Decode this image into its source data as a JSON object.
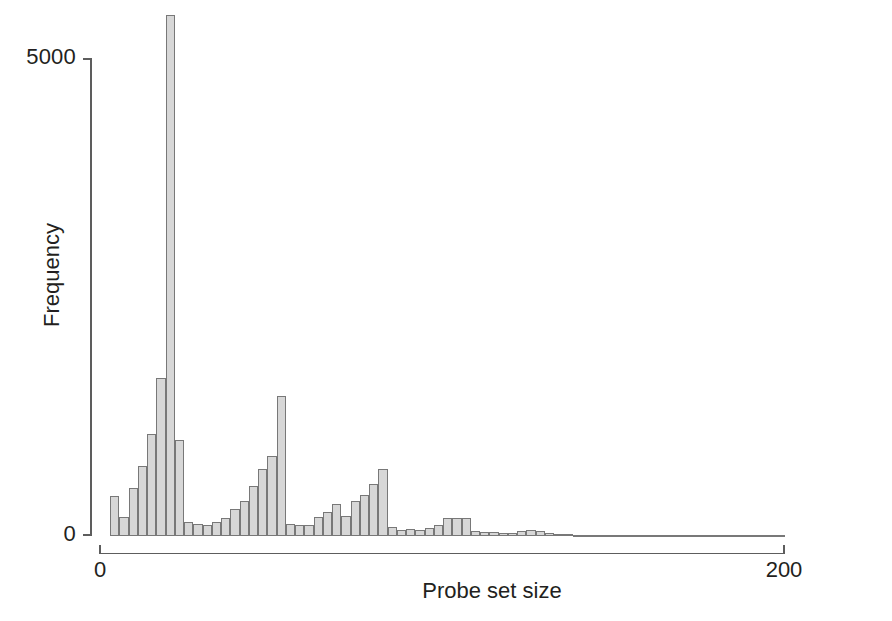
{
  "figure": {
    "background": "#ffffff",
    "width": 892,
    "height": 621
  },
  "axis_titles": {
    "x": "Probe set size",
    "y": "Frequency"
  },
  "ticks": {
    "y": [
      "0",
      "5000"
    ],
    "x": [
      "0",
      "200"
    ]
  },
  "style": {
    "bar_fill": "#d7d7d7",
    "bar_stroke": "#787878",
    "axis_color": "#5d5d5d",
    "text_color": "#231f20"
  },
  "chart_data": {
    "type": "bar",
    "title": "",
    "subtitle": "",
    "xlabel": "Probe set size",
    "ylabel": "Frequency",
    "xlim": [
      0,
      200
    ],
    "ylim": [
      0,
      5700
    ],
    "grid": false,
    "legend": null,
    "bin_width": 2.7,
    "x": [
      4.6,
      7.3,
      10.0,
      12.7,
      15.4,
      18.1,
      20.8,
      23.5,
      26.2,
      28.9,
      31.6,
      34.3,
      37.0,
      39.7,
      42.4,
      45.1,
      47.8,
      50.5,
      53.2,
      55.9,
      58.6,
      61.3,
      64.0,
      66.7,
      69.4,
      72.1,
      74.8,
      77.5,
      80.2,
      82.9,
      85.6,
      88.3,
      91.0,
      93.7,
      96.4,
      99.1,
      101.8,
      104.5,
      107.2,
      109.9,
      112.6,
      115.3,
      118.0,
      120.7,
      123.4,
      126.1,
      128.8,
      131.5,
      134.2,
      136.9,
      139.6,
      142.3,
      145.0,
      147.7,
      150.4,
      153.1,
      155.8,
      158.5,
      161.2,
      163.9,
      166.6,
      169.3,
      172.0,
      174.7,
      177.4,
      180.1,
      182.8,
      185.5,
      188.2,
      190.9,
      193.6,
      196.3,
      199.0
    ],
    "values": [
      420,
      200,
      500,
      730,
      1070,
      1650,
      5450,
      1000,
      150,
      130,
      120,
      150,
      190,
      280,
      370,
      520,
      700,
      840,
      1460,
      130,
      110,
      110,
      200,
      250,
      330,
      210,
      370,
      430,
      540,
      700,
      90,
      60,
      70,
      60,
      80,
      110,
      190,
      190,
      190,
      50,
      40,
      40,
      35,
      35,
      55,
      60,
      50,
      30,
      20,
      18,
      15,
      14,
      12,
      10,
      9,
      8,
      8,
      7,
      6,
      6,
      5,
      5,
      4,
      4,
      4,
      3,
      3,
      3,
      2,
      2,
      2,
      2,
      12
    ]
  }
}
